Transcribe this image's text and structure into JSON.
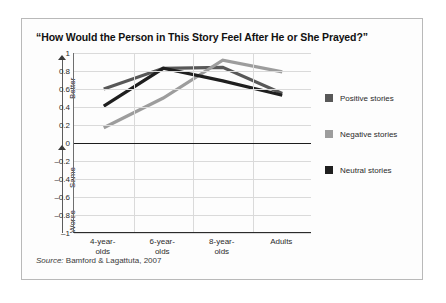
{
  "title": "“How Would the Person in This Story Feel After He or She Prayed?”",
  "source": {
    "label": "Source:",
    "text": " Bamford & Lagattuta, 2007"
  },
  "axis": {
    "direction_labels": {
      "better": "Better",
      "same": "Same",
      "worse": "Worse"
    }
  },
  "legend": {
    "items": [
      {
        "label": "Positive stories",
        "color": "#585858"
      },
      {
        "label": "Negative stories",
        "color": "#9d9d9d"
      },
      {
        "label": "Neutral stories",
        "color": "#1f1f1f"
      }
    ]
  },
  "chart_data": {
    "type": "line",
    "title": "“How Would the Person in This Story Feel After He or She Prayed?”",
    "xlabel": "",
    "ylabel": "",
    "ylim": [
      -1,
      1
    ],
    "yticks": [
      1,
      0.8,
      0.6,
      0.4,
      0.2,
      0,
      -0.2,
      -0.4,
      -0.6,
      -0.8,
      -1
    ],
    "ytick_labels": [
      "1",
      "0.8",
      "0.6",
      "0.4",
      "0.2",
      "0",
      "–0.2",
      "–0.4",
      "–0.6",
      "–0.8",
      "–1"
    ],
    "categories": [
      "4-year-olds",
      "6-year-olds",
      "8-year-olds",
      "Adults"
    ],
    "category_labels": [
      [
        "4-year-",
        "olds"
      ],
      [
        "6-year-",
        "olds"
      ],
      [
        "8-year-",
        "olds"
      ],
      [
        "Adults",
        ""
      ]
    ],
    "grid": true,
    "legend_position": "right",
    "zero_line": 0,
    "series": [
      {
        "name": "Positive stories",
        "color": "#585858",
        "values": [
          0.6,
          0.83,
          0.84,
          0.55
        ]
      },
      {
        "name": "Negative stories",
        "color": "#9d9d9d",
        "values": [
          0.17,
          0.5,
          0.92,
          0.79
        ]
      },
      {
        "name": "Neutral stories",
        "color": "#1f1f1f",
        "values": [
          0.41,
          0.83,
          0.69,
          0.53
        ]
      }
    ]
  }
}
